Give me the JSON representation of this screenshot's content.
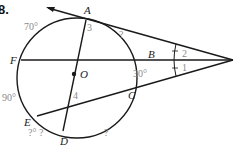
{
  "problem": {
    "number": "8."
  },
  "points": {
    "A": "A",
    "B": "B",
    "C": "C",
    "D": "D",
    "E": "E",
    "F": "F",
    "O": "O"
  },
  "angles": {
    "a1": "1",
    "a2": "2",
    "a3": "3",
    "a4": "4"
  },
  "arcs": {
    "AF": "70°",
    "FE": "90°",
    "BC": "30°",
    "AB": "?",
    "ED": "?° ?",
    "DC": "?"
  },
  "colors": {
    "line": "#1a1a1a",
    "label_gray": "#8a8a8a"
  }
}
